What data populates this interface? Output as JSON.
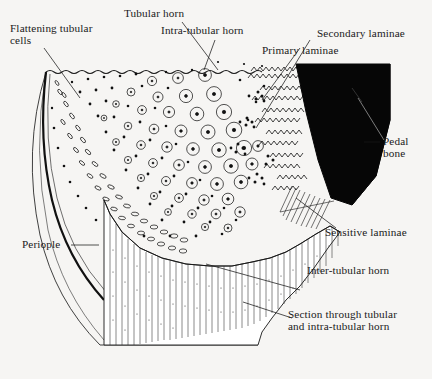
{
  "figure": {
    "background_color": "#f6f5f3",
    "ink_color": "#111111",
    "fill_black": "#000000"
  },
  "labels": {
    "flattening_tubular_cells": "Flattening tubular\ncells",
    "tubular_horn": "Tubular horn",
    "intra_tubular_horn": "Intra-tubular horn",
    "primary_laminae": "Primary laminae",
    "secondary_laminae": "Secondary laminae",
    "pedal_bone": "Pedal\nbone",
    "sensitive_laminae": "Sensitive laminae",
    "inter_tubular_horn": "Inter-tubular horn",
    "section_through": "Section through tubular\nand intra-tubular horn",
    "periople": "Periople"
  },
  "structures": {
    "tubular_horn_region": "tubular-horn-cross-section",
    "pedal_bone_region": "pedal-bone-wedge",
    "striated_face": "section-face-striations",
    "laminae_region": "wavy-laminae-band",
    "periople_band": "periople-outer-band"
  }
}
